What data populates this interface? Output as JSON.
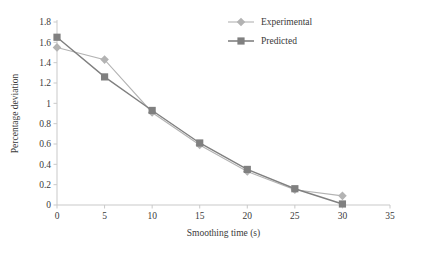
{
  "chart_data": {
    "type": "line",
    "title": "",
    "subtitle": "",
    "xlabel": "Smoothing time (s)",
    "ylabel": "Percentage deviation",
    "x": [
      0,
      5,
      10,
      15,
      20,
      25,
      30
    ],
    "xlim": [
      0,
      35
    ],
    "ylim": [
      0,
      1.8
    ],
    "xticks": [
      "0",
      "5",
      "10",
      "15",
      "20",
      "25",
      "30",
      "35"
    ],
    "xtick_values": [
      0,
      5,
      10,
      15,
      20,
      25,
      30,
      35
    ],
    "yticks": [
      "0",
      "0.2",
      "0.4",
      "0.6",
      "0.8",
      "1",
      "1.2",
      "1.4",
      "1.6",
      "1.8"
    ],
    "ytick_values": [
      0,
      0.2,
      0.4,
      0.6,
      0.8,
      1.0,
      1.2,
      1.4,
      1.6,
      1.8
    ],
    "grid": false,
    "legend_position": "top-right",
    "series": [
      {
        "name": "Experimental",
        "marker": "diamond",
        "color": "#b3b3b3",
        "values": [
          1.55,
          1.43,
          0.91,
          0.59,
          0.33,
          0.15,
          0.09
        ]
      },
      {
        "name": "Predicted",
        "marker": "square",
        "color": "#808080",
        "values": [
          1.65,
          1.26,
          0.93,
          0.61,
          0.35,
          0.16,
          0.01
        ]
      }
    ],
    "annotations": []
  },
  "colors": {
    "experimental": "#b3b3b3",
    "predicted": "#808080",
    "axis": "#c9c9c9",
    "text": "#3a3a3a",
    "background": "#ffffff"
  }
}
